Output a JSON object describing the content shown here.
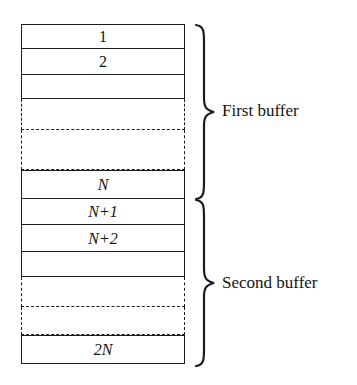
{
  "figure": {
    "background_color": "#ffffff",
    "line_color": "#1c1c1c",
    "text_color": "#141414"
  },
  "buffers": [
    {
      "name": "first-buffer",
      "label": "First buffer",
      "slots": [
        {
          "label": "1",
          "kind": "solid",
          "top": 0,
          "height": 25
        },
        {
          "label": "2",
          "kind": "solid",
          "top": 25,
          "height": 26
        },
        {
          "label": "",
          "kind": "solid",
          "top": 51,
          "height": 24
        },
        {
          "label": "",
          "kind": "dashed",
          "top": 75,
          "height": 31
        },
        {
          "label": "",
          "kind": "dashed",
          "top": 106,
          "height": 40
        },
        {
          "label": "N",
          "kind": "solid",
          "top": 146,
          "height": 29
        }
      ]
    },
    {
      "name": "second-buffer",
      "label": "Second buffer",
      "slots": [
        {
          "label": "N+1",
          "kind": "solid",
          "top": 175,
          "height": 26
        },
        {
          "label": "N+2",
          "kind": "solid",
          "top": 201,
          "height": 27
        },
        {
          "label": "",
          "kind": "solid",
          "top": 228,
          "height": 25
        },
        {
          "label": "",
          "kind": "dashed",
          "top": 253,
          "height": 30
        },
        {
          "label": "",
          "kind": "dashed",
          "top": 283,
          "height": 28
        },
        {
          "label": "2N",
          "kind": "solid",
          "top": 311,
          "height": 29
        }
      ]
    }
  ],
  "braces": [
    {
      "name": "first-buffer-brace",
      "top": 24,
      "height": 176
    },
    {
      "name": "second-buffer-brace",
      "top": 199,
      "height": 166
    }
  ],
  "labels": {
    "first_buffer": "First buffer",
    "second_buffer": "Second buffer"
  }
}
